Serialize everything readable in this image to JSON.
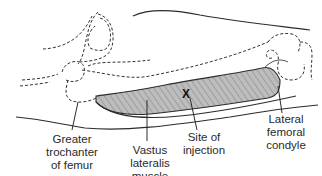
{
  "figure": {
    "marker_symbol": "X",
    "colors": {
      "outline": "#2b2b2b",
      "muscle_fill": "#b8b8b8",
      "hatching": "#7a7a7a",
      "background": "#ffffff"
    }
  },
  "labels": {
    "greater_trochanter": [
      "Greater",
      "trochanter",
      "of femur"
    ],
    "vastus_lateralis": [
      "Vastus",
      "lateralis",
      "muscle"
    ],
    "site_of_injection": [
      "Site of",
      "injection"
    ],
    "lateral_femoral_condyle": [
      "Lateral",
      "femoral",
      "condyle"
    ]
  }
}
